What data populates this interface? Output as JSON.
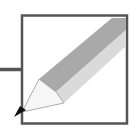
{
  "icon": {
    "name": "pencil-edit-icon",
    "colors": {
      "frame": "#555555",
      "pencil_dark": "#a8a8a8",
      "pencil_light": "#d8d8d8",
      "tip_wood": "#f4f4f4",
      "lead": "#111111"
    }
  }
}
